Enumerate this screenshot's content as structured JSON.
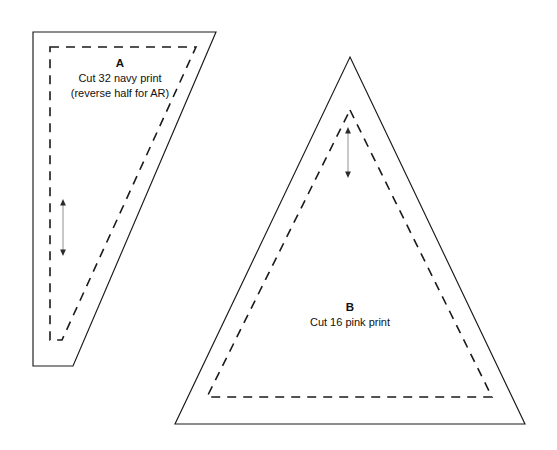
{
  "sheet": {
    "title": "Quilt Template Pattern Sheet",
    "width": 557,
    "height": 450,
    "background_color": "#ffffff",
    "line_color": "#1a1a1a",
    "grain_arrow_color": "#9a9a9a"
  },
  "pieces": [
    {
      "id": "piece-a",
      "letter": "A",
      "instruction_line_1": "Cut 32 navy print",
      "instruction_line_2": "(reverse half for AR)",
      "shape": "quadrilateral",
      "cut_line_points": "33,32 216,32 73,366 33,366",
      "seam_line_points": "50,47 196,47 62,340 50,340",
      "grain_arrow": {
        "x": 63,
        "y_top": 200,
        "y_bottom": 255
      }
    },
    {
      "id": "piece-b",
      "letter": "B",
      "instruction_line_1": "Cut 16 pink print",
      "instruction_line_2": "",
      "shape": "triangle",
      "cut_line_points": "350,57 525,424 175,424",
      "seam_line_points": "350,110 492,397 207,397",
      "grain_arrow": {
        "x": 348,
        "y_top": 128,
        "y_bottom": 177
      }
    }
  ],
  "legend": {
    "cut_line_name": "solid cutting line",
    "seam_line_name": "dashed seam line",
    "grain_arrow_name": "grain direction arrow"
  }
}
